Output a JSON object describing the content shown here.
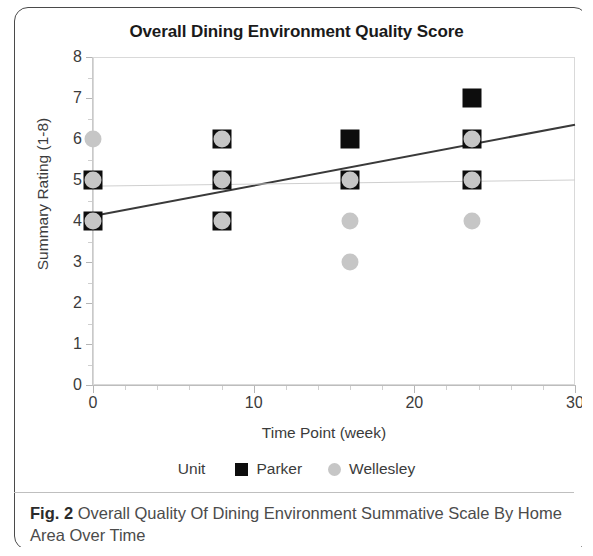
{
  "figure": {
    "caption_label": "Fig. 2",
    "caption_text": "Overall Quality Of Dining Environment Summative Scale By Home Area Over Time"
  },
  "chart_data": {
    "type": "scatter",
    "title": "Overall Dining Environment Quality Score",
    "xlabel": "Time Point (week)",
    "ylabel": "Summary Rating (1-8)",
    "xlim": [
      0,
      30
    ],
    "ylim": [
      0,
      8
    ],
    "x_ticks": [
      0,
      10,
      20,
      30
    ],
    "x_tick_labels": [
      "0",
      "10",
      "20",
      "30"
    ],
    "x_minor_step": 2,
    "y_ticks": [
      0,
      1,
      2,
      3,
      4,
      5,
      6,
      7,
      8
    ],
    "y_tick_labels": [
      "0",
      "1",
      "2",
      "3",
      "4",
      "5",
      "6",
      "7",
      "8"
    ],
    "grid": false,
    "legend_title": "Unit",
    "legend_position": "bottom",
    "series": [
      {
        "name": "Parker",
        "marker": "square",
        "color": "#0d0d0d",
        "points": [
          {
            "x": 0,
            "y": 5
          },
          {
            "x": 0,
            "y": 4
          },
          {
            "x": 8,
            "y": 6
          },
          {
            "x": 8,
            "y": 5
          },
          {
            "x": 8,
            "y": 4
          },
          {
            "x": 16,
            "y": 6
          },
          {
            "x": 16,
            "y": 5
          },
          {
            "x": 23.6,
            "y": 7
          },
          {
            "x": 23.6,
            "y": 6
          },
          {
            "x": 23.6,
            "y": 5
          }
        ]
      },
      {
        "name": "Wellesley",
        "marker": "circle",
        "color": "#c6c6c6",
        "points": [
          {
            "x": 0,
            "y": 6
          },
          {
            "x": 0,
            "y": 5
          },
          {
            "x": 0,
            "y": 4
          },
          {
            "x": 8,
            "y": 6
          },
          {
            "x": 8,
            "y": 5
          },
          {
            "x": 8,
            "y": 4
          },
          {
            "x": 16,
            "y": 5
          },
          {
            "x": 16,
            "y": 4
          },
          {
            "x": 16,
            "y": 3
          },
          {
            "x": 23.6,
            "y": 6
          },
          {
            "x": 23.6,
            "y": 5
          },
          {
            "x": 23.6,
            "y": 4
          }
        ]
      }
    ],
    "trend_lines": [
      {
        "name": "Parker",
        "color": "#3a3a3a",
        "width": 2,
        "x0": 0,
        "y0": 4.12,
        "x1": 30,
        "y1": 6.35
      },
      {
        "name": "Wellesley",
        "color": "#cfcfcf",
        "width": 1,
        "x0": 0,
        "y0": 4.85,
        "x1": 30,
        "y1": 5.0
      }
    ]
  }
}
